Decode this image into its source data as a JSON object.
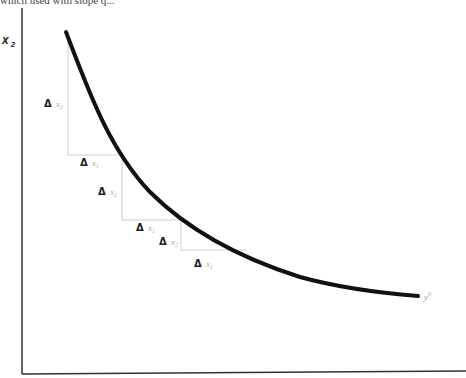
{
  "top_fragment": "which used with slope q...",
  "axes": {
    "y_label": "x",
    "y_label_sub": "2"
  },
  "curve": {
    "label": "y",
    "label_sup": "0"
  },
  "steps": [
    {
      "delta": "Δ",
      "var": "x",
      "sub": "2"
    },
    {
      "delta": "Δ",
      "var": "x",
      "sub": "1"
    },
    {
      "delta": "Δ",
      "var": "x",
      "sub": "2"
    },
    {
      "delta": "Δ",
      "var": "x",
      "sub": "1"
    },
    {
      "delta": "Δ",
      "var": "x",
      "sub": "2"
    },
    {
      "delta": "Δ",
      "var": "x",
      "sub": "1"
    }
  ],
  "colors": {
    "curve": "#111111",
    "axis": "#333333",
    "guide": "#cccccc"
  }
}
